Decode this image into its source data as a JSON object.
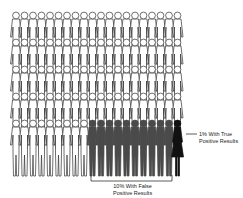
{
  "pictogram": {
    "rows": 5,
    "columns": 20,
    "total_figures": 100,
    "colors": {
      "negative": "#ffffff",
      "outline": "#333333",
      "false_positive": "#4a4a4a",
      "true_positive": "#111111"
    },
    "groups": [
      {
        "name": "negative",
        "count": 89
      },
      {
        "name": "false_positive",
        "count": 10
      },
      {
        "name": "true_positive",
        "count": 1
      }
    ]
  },
  "labels": {
    "true_positive_line1": "1% With True",
    "true_positive_line2": "Positive Results",
    "false_positive_line1": "10% With False",
    "false_positive_line2": "Positive Results"
  }
}
